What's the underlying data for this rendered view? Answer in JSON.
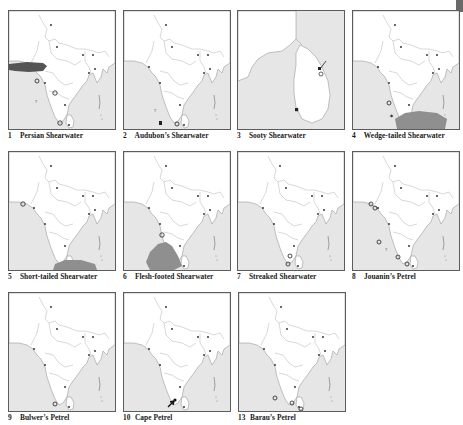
{
  "page": {
    "corner_mark": "page-edge-tab"
  },
  "colors": {
    "sea": "#e6e6e6",
    "land": "#ffffff",
    "border": "#5c5c5c",
    "outline": "#9a9a9a",
    "range_dark": "#555555",
    "range_mid": "#8f8f8f",
    "marker": "#1a1a1a"
  },
  "panels": [
    {
      "number": "1",
      "name": "Persian Shearwater",
      "map": "india",
      "overlays": [
        {
          "type": "range-patch",
          "shade": "dark",
          "area": "off Gujarat / Makran coast"
        }
      ],
      "markers": [
        "open-circle",
        "question-mark",
        "open-circle"
      ]
    },
    {
      "number": "2",
      "name": "Audubon’s Shearwater",
      "map": "india",
      "overlays": [],
      "markers": [
        "question-mark",
        "filled-square",
        "open-circle"
      ]
    },
    {
      "number": "3",
      "name": "Sooty Shearwater",
      "map": "sri-lanka",
      "overlays": [],
      "markers": [
        "arrow",
        "open-circle",
        "filled-square"
      ]
    },
    {
      "number": "4",
      "name": "Wedge-tailed Shearwater",
      "map": "india",
      "overlays": [
        {
          "type": "range-patch",
          "shade": "mid",
          "area": "south of Sri Lanka"
        }
      ],
      "markers": [
        "open-circle",
        "star"
      ]
    },
    {
      "number": "5",
      "name": "Short-tailed Shearwater",
      "map": "india",
      "overlays": [
        {
          "type": "range-patch",
          "shade": "mid",
          "area": "south of Sri Lanka"
        }
      ],
      "markers": [
        "open-circle"
      ]
    },
    {
      "number": "6",
      "name": "Flesh-footed Shearwater",
      "map": "india",
      "overlays": [
        {
          "type": "range-patch",
          "shade": "mid",
          "area": "Arabian Sea off SW India"
        }
      ],
      "markers": [
        "open-circle"
      ]
    },
    {
      "number": "7",
      "name": "Streaked Shearwater",
      "map": "india",
      "overlays": [],
      "markers": [
        "open-circle",
        "open-circle"
      ]
    },
    {
      "number": "8",
      "name": "Jouanin’s Petrel",
      "map": "india",
      "overlays": [],
      "markers": [
        "open-circle",
        "open-circle",
        "open-circle",
        "question-mark",
        "open-circle"
      ]
    },
    {
      "number": "9",
      "name": "Bulwer’s Petrel",
      "map": "india",
      "overlays": [],
      "markers": [
        "open-circle"
      ]
    },
    {
      "number": "10",
      "name": "Cape Petrel",
      "map": "india",
      "overlays": [],
      "markers": [
        "arrow"
      ]
    },
    {
      "number": "13",
      "name": "Barau’s Petrel",
      "map": "india",
      "overlays": [],
      "markers": [
        "open-circle",
        "open-circle",
        "open-circle"
      ]
    }
  ]
}
